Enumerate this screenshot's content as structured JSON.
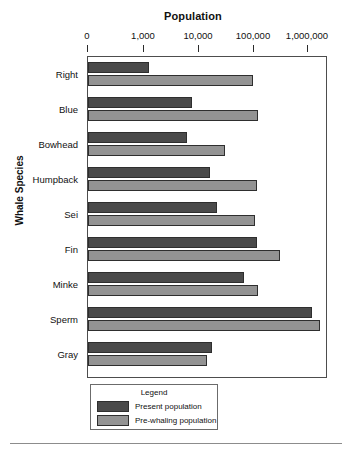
{
  "chart_data": {
    "type": "bar",
    "orientation": "horizontal",
    "title": "Population",
    "xlabel": "Population",
    "ylabel": "Whale Species",
    "xscale": "log",
    "xticks": [
      0,
      1000,
      10000,
      100000,
      1000000
    ],
    "xtick_labels": [
      "0",
      "1,000",
      "10,000",
      "100,000",
      "1,000,000"
    ],
    "xlim": [
      0,
      4000000
    ],
    "grid": false,
    "legend_position": "below-plot",
    "legend_title": "Legend",
    "categories": [
      "Right",
      "Blue",
      "Bowhead",
      "Humpback",
      "Sei",
      "Fin",
      "Minke",
      "Sperm",
      "Gray"
    ],
    "series": [
      {
        "name": "Present population",
        "color": "#4a4a4a",
        "values": [
          1400,
          9000,
          6500,
          25000,
          20000,
          110000,
          70000,
          1300000,
          22000
        ]
      },
      {
        "name": "Pre-whaling population",
        "color": "#939393",
        "values": [
          100000,
          150000,
          30000,
          115000,
          100000,
          350000,
          120000,
          2000000,
          18000
        ]
      }
    ],
    "bar_pixel_ends": {
      "present": [
        149,
        192,
        187,
        210,
        217,
        257,
        244,
        312,
        212
      ],
      "prewhaling": [
        253,
        258,
        225,
        257,
        255,
        280,
        258,
        320,
        207
      ]
    }
  },
  "axis": {
    "title": "Population",
    "y_title": "Whale Species",
    "ticks": [
      {
        "label": "0",
        "pos": 0
      },
      {
        "label": "1,000",
        "pos": 56
      },
      {
        "label": "10,000",
        "pos": 111
      },
      {
        "label": "100,000",
        "pos": 166
      },
      {
        "label": "1,000,000",
        "pos": 220
      }
    ]
  },
  "legend": {
    "title": "Legend",
    "items": [
      {
        "label": "Present population",
        "color": "#4a4a4a"
      },
      {
        "label": "Pre-whaling population",
        "color": "#939393"
      }
    ]
  },
  "colors": {
    "present": "#4a4a4a",
    "prewhaling": "#939393",
    "frame": "#4d4d4d",
    "text": "#111111"
  }
}
